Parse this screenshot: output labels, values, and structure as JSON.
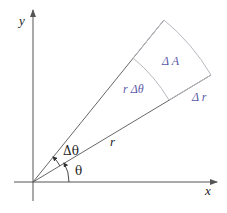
{
  "diagram": {
    "type": "polar-area-element",
    "colors": {
      "axis": "#555555",
      "ray": "#555555",
      "arc": "#b8b8c0",
      "label_black": "#222222",
      "label_blue": "#5a5aa8"
    },
    "labels": {
      "x_axis": "x",
      "y_axis": "y",
      "theta": "θ",
      "delta_theta": "Δθ",
      "r": "r",
      "r_delta_theta": "r Δθ",
      "delta_A": "Δ A",
      "delta_r": "Δ r"
    },
    "geometry": {
      "origin": [
        33,
        182
      ],
      "theta_deg": 31,
      "delta_theta_deg": 20,
      "inner_radius": 159,
      "outer_radius": 208
    }
  }
}
